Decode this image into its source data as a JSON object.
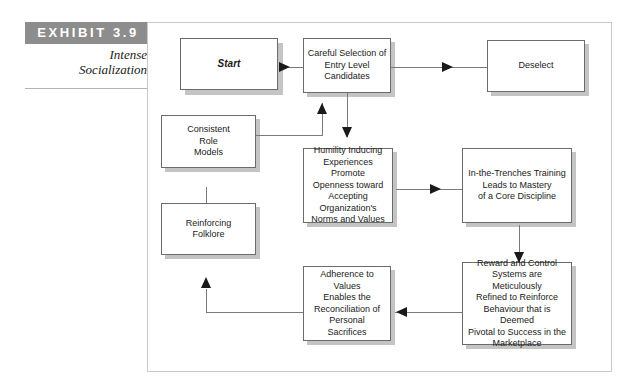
{
  "exhibit": {
    "banner_label": "EXHIBIT 3.9",
    "title_line_1": "Intense",
    "title_line_2": "Socialization",
    "banner_color": "#8d8d8d",
    "frame_border_color": "#c9c9c9"
  },
  "diagram": {
    "type": "flowchart",
    "node_border_color": "#6b6b6b",
    "node_shadow_color": "#c4c4c4",
    "connector_color": "#7a7a7a",
    "arrow_color": "#1a1a1a",
    "nodes": [
      {
        "id": "start",
        "label": "Start"
      },
      {
        "id": "selection",
        "label": "Careful Selection of\nEntry Level\nCandidates"
      },
      {
        "id": "deselect",
        "label": "Deselect"
      },
      {
        "id": "rolemodels",
        "label": "Consistent\nRole\nModels"
      },
      {
        "id": "humility",
        "label": "Humility Inducing\nExperiences Promote\nOpenness toward\nAccepting Organization's\nNorms and Values"
      },
      {
        "id": "trenches",
        "label": "In-the-Trenches Training\nLeads to Mastery\nof a Core Discipline"
      },
      {
        "id": "folklore",
        "label": "Reinforcing\nFolklore"
      },
      {
        "id": "adherence",
        "label": "Adherence to Values\nEnables the\nReconciliation of\nPersonal\nSacrifices"
      },
      {
        "id": "reward",
        "label": "Reward and Control\nSystems are Meticulously\nRefined to Reinforce\nBehaviour that is Deemed\nPivotal to Success in the\nMarketplace"
      }
    ],
    "edges": [
      {
        "from": "start",
        "to": "selection",
        "direction": "right"
      },
      {
        "from": "selection",
        "to": "deselect",
        "direction": "right"
      },
      {
        "from": "selection",
        "to": "humility",
        "direction": "down"
      },
      {
        "from": "rolemodels",
        "to": "selection",
        "direction": "up"
      },
      {
        "from": "humility",
        "to": "trenches",
        "direction": "right"
      },
      {
        "from": "trenches",
        "to": "reward",
        "direction": "down"
      },
      {
        "from": "reward",
        "to": "adherence",
        "direction": "left"
      },
      {
        "from": "adherence",
        "to": "folklore",
        "direction": "up"
      },
      {
        "from": "folklore",
        "to": "rolemodels",
        "direction": "up"
      }
    ]
  }
}
